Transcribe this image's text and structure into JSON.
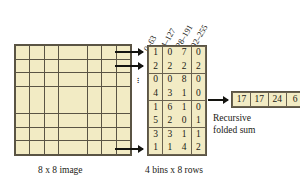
{
  "image_grid": {
    "rows": 8,
    "cols": 8,
    "caption": "8 x 8 image"
  },
  "histogram": {
    "caption": "4 bins x 8 rows",
    "bin_labels": [
      "0–63",
      "64–127",
      "128–191",
      "192–255"
    ],
    "rows": [
      [
        1,
        0,
        7,
        0
      ],
      [
        2,
        2,
        2,
        2
      ],
      [
        0,
        0,
        8,
        0
      ],
      [
        4,
        3,
        1,
        0
      ],
      [
        1,
        6,
        1,
        0
      ],
      [
        5,
        2,
        0,
        1
      ],
      [
        3,
        3,
        1,
        1
      ],
      [
        1,
        1,
        4,
        2
      ]
    ]
  },
  "output": {
    "values": [
      17,
      17,
      24,
      6
    ],
    "label_line1": "Recursive",
    "label_line2": "folded sum"
  },
  "ellipsis": "⋮",
  "colors": {
    "cell_fill": "#f2ebc4",
    "cell_border": "#5a5444",
    "text": "#1a1a14",
    "arrow": "#141410",
    "background": "#ffffff"
  }
}
